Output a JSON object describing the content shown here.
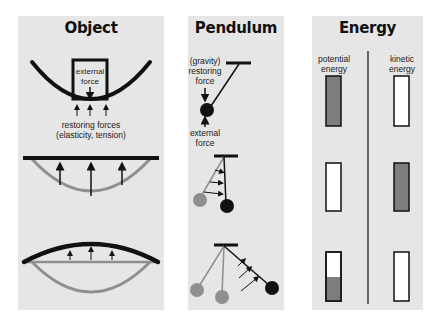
{
  "panels": {
    "object": {
      "title": "Object",
      "box_label_line1": "external",
      "box_label_line2": "force",
      "restoring_line1": "restoring forces",
      "restoring_line2": "(elasticity, tension)"
    },
    "pendulum": {
      "title": "Pendulum",
      "restoring_line1": "(gravity)",
      "restoring_line2": "restoring",
      "restoring_line3": "force",
      "external_line1": "external",
      "external_line2": "force"
    },
    "energy": {
      "title": "Energy",
      "potential_line1": "potential",
      "potential_line2": "energy",
      "kinetic_line1": "kinetic",
      "kinetic_line2": "energy",
      "rows": [
        {
          "potential_fill_pct": 100,
          "kinetic_fill_pct": 0
        },
        {
          "potential_fill_pct": 0,
          "kinetic_fill_pct": 100
        },
        {
          "potential_fill_pct": 50,
          "kinetic_fill_pct": 0
        }
      ]
    }
  },
  "colors": {
    "panel_bg": "#e6e6e6",
    "ink": "#111111",
    "ghost": "#8f8f8f",
    "bar_fill": "#7d7d7d"
  }
}
